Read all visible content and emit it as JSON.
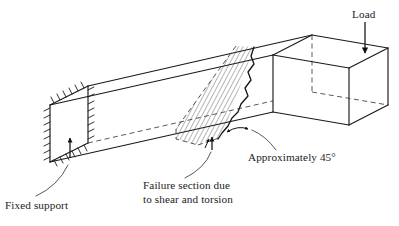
{
  "figure": {
    "background_color": "#ffffff",
    "line_color": "#1a1a1a",
    "hatch_color": "#2a2a2a"
  },
  "labels": {
    "load": "Load",
    "fixed_support": "Fixed support",
    "failure_section_line1": "Failure section due",
    "failure_section_line2": "to shear and torsion",
    "angle": "Approximately 45°"
  },
  "annotations": [
    {
      "name": "load-label",
      "text": "Load",
      "x": 352,
      "y": 16,
      "pointer": "down-arrow",
      "target_x": 365,
      "target_y": 52
    },
    {
      "name": "fixed-support-label",
      "text": "Fixed support",
      "x": 5,
      "y": 208,
      "pointer": "curved-leader-up-arrow",
      "target_x": 71,
      "target_y": 136
    },
    {
      "name": "failure-section-label",
      "text": "Failure section due to shear and torsion",
      "x": 143,
      "y": 190,
      "pointer": "curved-leader-up-arrow",
      "target_x": 212,
      "target_y": 138
    },
    {
      "name": "angle-label",
      "text": "Approximately 45°",
      "x": 248,
      "y": 160,
      "pointer": "curved-leader-to-double-arrow",
      "target_x": 240,
      "target_y": 130
    }
  ],
  "geometry": {
    "beam_type": "L-shaped cantilever",
    "fixed_end_face": {
      "x": 50,
      "y": 105,
      "width": 38,
      "height": 57
    },
    "load_end_block": {
      "x": 333,
      "y": 40,
      "width": 55,
      "height": 85
    },
    "failure_section_angle_deg": 45,
    "hatch_spacing_px": 4
  },
  "icons": {
    "load_arrow": "down-arrow-icon",
    "support_hatching": "fixed-support-hatch-icon",
    "angle_marker": "double-headed-arrow-icon"
  }
}
